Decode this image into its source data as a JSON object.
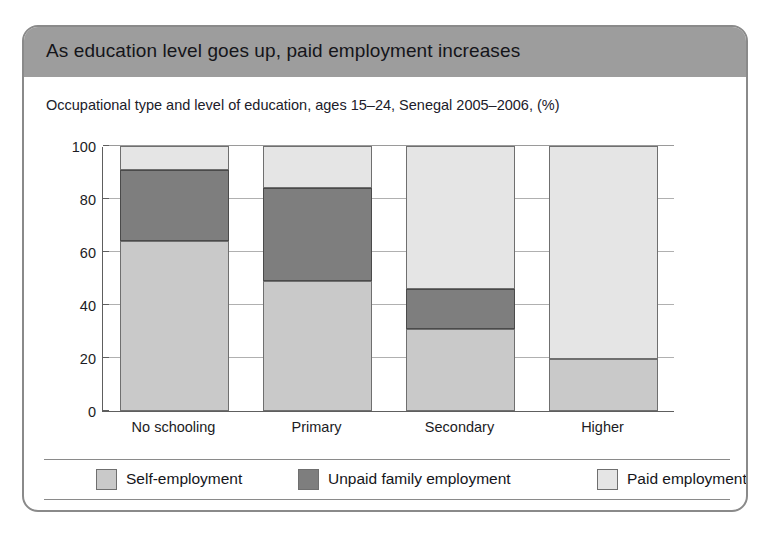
{
  "card": {
    "title": "As education level goes up, paid employment increases",
    "subtitle": "Occupational type and level of education, ages 15–24, Senegal 2005–2006, (%)",
    "source": "Source: Understanding Children's Work (UCW) calculations based on Senegal Poverty Survey 2005–2006"
  },
  "colors": {
    "header_band": "#9d9d9d",
    "card_border": "#8a8a8a",
    "self_employment": "#c9c9c9",
    "unpaid_family_employment": "#7e7e7e",
    "paid_employment": "#e5e5e5",
    "axis": "#5e5e5e",
    "gridline": "#b0b0b0"
  },
  "chart_data": {
    "type": "bar",
    "subtype": "stacked-100-percent",
    "title": "As education level goes up, paid employment increases",
    "subtitle": "Occupational type and level of education, ages 15–24, Senegal 2005–2006, (%)",
    "xlabel": "",
    "ylabel": "",
    "ylim": [
      0,
      100
    ],
    "yticks": [
      0,
      20,
      40,
      60,
      80,
      100
    ],
    "ytick_labels": [
      "0",
      "20",
      "40",
      "60",
      "80",
      "100"
    ],
    "grid": true,
    "legend_position": "bottom",
    "categories": [
      "No schooling",
      "Primary",
      "Secondary",
      "Higher"
    ],
    "series": [
      {
        "name": "Self-employment",
        "color": "#c9c9c9",
        "values": [
          64,
          49,
          31,
          19.5
        ]
      },
      {
        "name": "Unpaid family employment",
        "color": "#7e7e7e",
        "values": [
          27,
          35,
          15,
          0
        ]
      },
      {
        "name": "Paid employment",
        "color": "#e5e5e5",
        "values": [
          9,
          16,
          54,
          80.5
        ]
      }
    ],
    "cumulative_tops": {
      "Self-employment": [
        64,
        49,
        31,
        19.5
      ],
      "Unpaid family employment": [
        91,
        84,
        46,
        19.5
      ],
      "Paid employment": [
        100,
        100,
        100,
        100
      ]
    }
  }
}
